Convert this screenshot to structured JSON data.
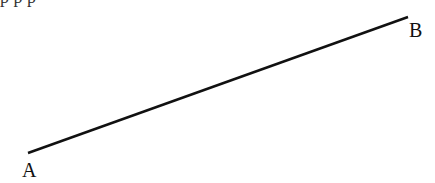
{
  "diagram": {
    "caption_fragment": "p                               p p",
    "segment": {
      "start": {
        "label": "A",
        "x": 28,
        "y": 153
      },
      "end": {
        "label": "B",
        "x": 408,
        "y": 17
      },
      "stroke": "#111111",
      "stroke_width": 2.5
    },
    "labels": {
      "a": "A",
      "b": "B"
    }
  }
}
